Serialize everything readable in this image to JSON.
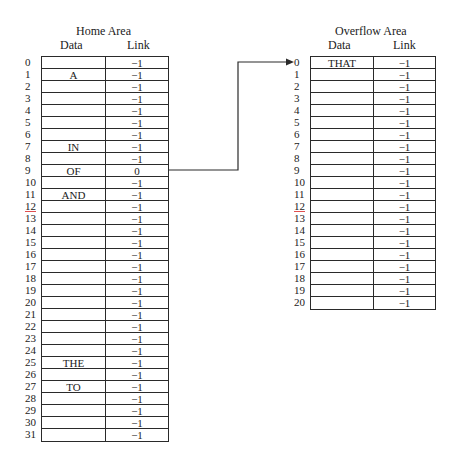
{
  "home": {
    "title": "Home Area",
    "headers": {
      "data": "Data",
      "link": "Link"
    },
    "rows": [
      {
        "index": "0",
        "data": "",
        "link": "−1"
      },
      {
        "index": "1",
        "data": "A",
        "link": "−1"
      },
      {
        "index": "2",
        "data": "",
        "link": "−1"
      },
      {
        "index": "3",
        "data": "",
        "link": "−1"
      },
      {
        "index": "4",
        "data": "",
        "link": "−1"
      },
      {
        "index": "5",
        "data": "",
        "link": "−1"
      },
      {
        "index": "6",
        "data": "",
        "link": "−1"
      },
      {
        "index": "7",
        "data": "IN",
        "link": "−1"
      },
      {
        "index": "8",
        "data": "",
        "link": "−1"
      },
      {
        "index": "9",
        "data": "OF",
        "link": "0"
      },
      {
        "index": "10",
        "data": "",
        "link": "−1"
      },
      {
        "index": "11",
        "data": "AND",
        "link": "−1"
      },
      {
        "index": "12",
        "data": "",
        "link": "−1"
      },
      {
        "index": "13",
        "data": "",
        "link": "−1"
      },
      {
        "index": "14",
        "data": "",
        "link": "−1"
      },
      {
        "index": "15",
        "data": "",
        "link": "−1"
      },
      {
        "index": "16",
        "data": "",
        "link": "−1"
      },
      {
        "index": "17",
        "data": "",
        "link": "−1"
      },
      {
        "index": "18",
        "data": "",
        "link": "−1"
      },
      {
        "index": "19",
        "data": "",
        "link": "−1"
      },
      {
        "index": "20",
        "data": "",
        "link": "−1"
      },
      {
        "index": "21",
        "data": "",
        "link": "−1"
      },
      {
        "index": "22",
        "data": "",
        "link": "−1"
      },
      {
        "index": "23",
        "data": "",
        "link": "−1"
      },
      {
        "index": "24",
        "data": "",
        "link": "−1"
      },
      {
        "index": "25",
        "data": "THE",
        "link": "−1"
      },
      {
        "index": "26",
        "data": "",
        "link": "−1"
      },
      {
        "index": "27",
        "data": "TO",
        "link": "−1"
      },
      {
        "index": "28",
        "data": "",
        "link": "−1"
      },
      {
        "index": "29",
        "data": "",
        "link": "−1"
      },
      {
        "index": "30",
        "data": "",
        "link": "−1"
      },
      {
        "index": "31",
        "data": "",
        "link": "−1"
      }
    ]
  },
  "overflow": {
    "title": "Overflow Area",
    "headers": {
      "data": "Data",
      "link": "Link"
    },
    "rows": [
      {
        "index": "0",
        "data": "THAT",
        "link": "−1"
      },
      {
        "index": "1",
        "data": "",
        "link": "−1"
      },
      {
        "index": "2",
        "data": "",
        "link": "−1"
      },
      {
        "index": "3",
        "data": "",
        "link": "−1"
      },
      {
        "index": "4",
        "data": "",
        "link": "−1"
      },
      {
        "index": "5",
        "data": "",
        "link": "−1"
      },
      {
        "index": "6",
        "data": "",
        "link": "−1"
      },
      {
        "index": "7",
        "data": "",
        "link": "−1"
      },
      {
        "index": "8",
        "data": "",
        "link": "−1"
      },
      {
        "index": "9",
        "data": "",
        "link": "−1"
      },
      {
        "index": "10",
        "data": "",
        "link": "−1"
      },
      {
        "index": "11",
        "data": "",
        "link": "−1"
      },
      {
        "index": "12",
        "data": "",
        "link": "−1"
      },
      {
        "index": "13",
        "data": "",
        "link": "−1"
      },
      {
        "index": "14",
        "data": "",
        "link": "−1"
      },
      {
        "index": "15",
        "data": "",
        "link": "−1"
      },
      {
        "index": "16",
        "data": "",
        "link": "−1"
      },
      {
        "index": "17",
        "data": "",
        "link": "−1"
      },
      {
        "index": "18",
        "data": "",
        "link": "−1"
      },
      {
        "index": "19",
        "data": "",
        "link": "−1"
      },
      {
        "index": "20",
        "data": "",
        "link": "−1"
      }
    ]
  },
  "links": [
    {
      "from": "home.9",
      "to": "overflow.0",
      "label": ""
    }
  ],
  "style": {
    "line_color": "#2a2a2a",
    "mark_color": "#e05050"
  }
}
